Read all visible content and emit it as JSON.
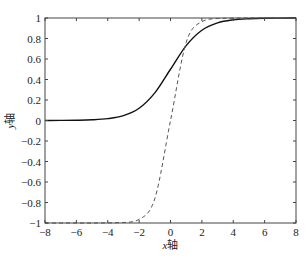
{
  "chart_data": {
    "type": "line",
    "title": "",
    "xlabel_var": "x",
    "xlabel_suffix": "轴",
    "ylabel_var": "y",
    "ylabel_suffix": "轴",
    "xlim": [
      -8,
      8
    ],
    "ylim": [
      -1,
      1
    ],
    "grid": false,
    "legend": null,
    "xticks": [
      -8,
      -6,
      -4,
      -2,
      0,
      2,
      4,
      6,
      8
    ],
    "yticks": [
      -1,
      -0.8,
      -0.6,
      -0.4,
      -0.2,
      0,
      0.2,
      0.4,
      0.6,
      0.8,
      1
    ],
    "x": [
      -8,
      -7,
      -6,
      -5,
      -4,
      -3,
      -2,
      -1,
      0,
      1,
      2,
      3,
      4,
      5,
      6,
      7,
      8
    ],
    "series": [
      {
        "name": "sigmoid",
        "style": "solid",
        "color": "#111111",
        "values": [
          0.0003,
          0.0009,
          0.0025,
          0.0067,
          0.018,
          0.047,
          0.119,
          0.269,
          0.5,
          0.731,
          0.881,
          0.953,
          0.982,
          0.993,
          0.998,
          0.999,
          1.0
        ]
      },
      {
        "name": "tanh",
        "style": "dashed",
        "color": "#555555",
        "values": [
          -1.0,
          -1.0,
          -1.0,
          -1.0,
          -0.999,
          -0.995,
          -0.964,
          -0.762,
          0.0,
          0.762,
          0.964,
          0.995,
          0.999,
          1.0,
          1.0,
          1.0,
          1.0
        ]
      }
    ]
  },
  "plot_area": {
    "left": 45,
    "right": 296,
    "top": 18,
    "bottom": 223
  }
}
